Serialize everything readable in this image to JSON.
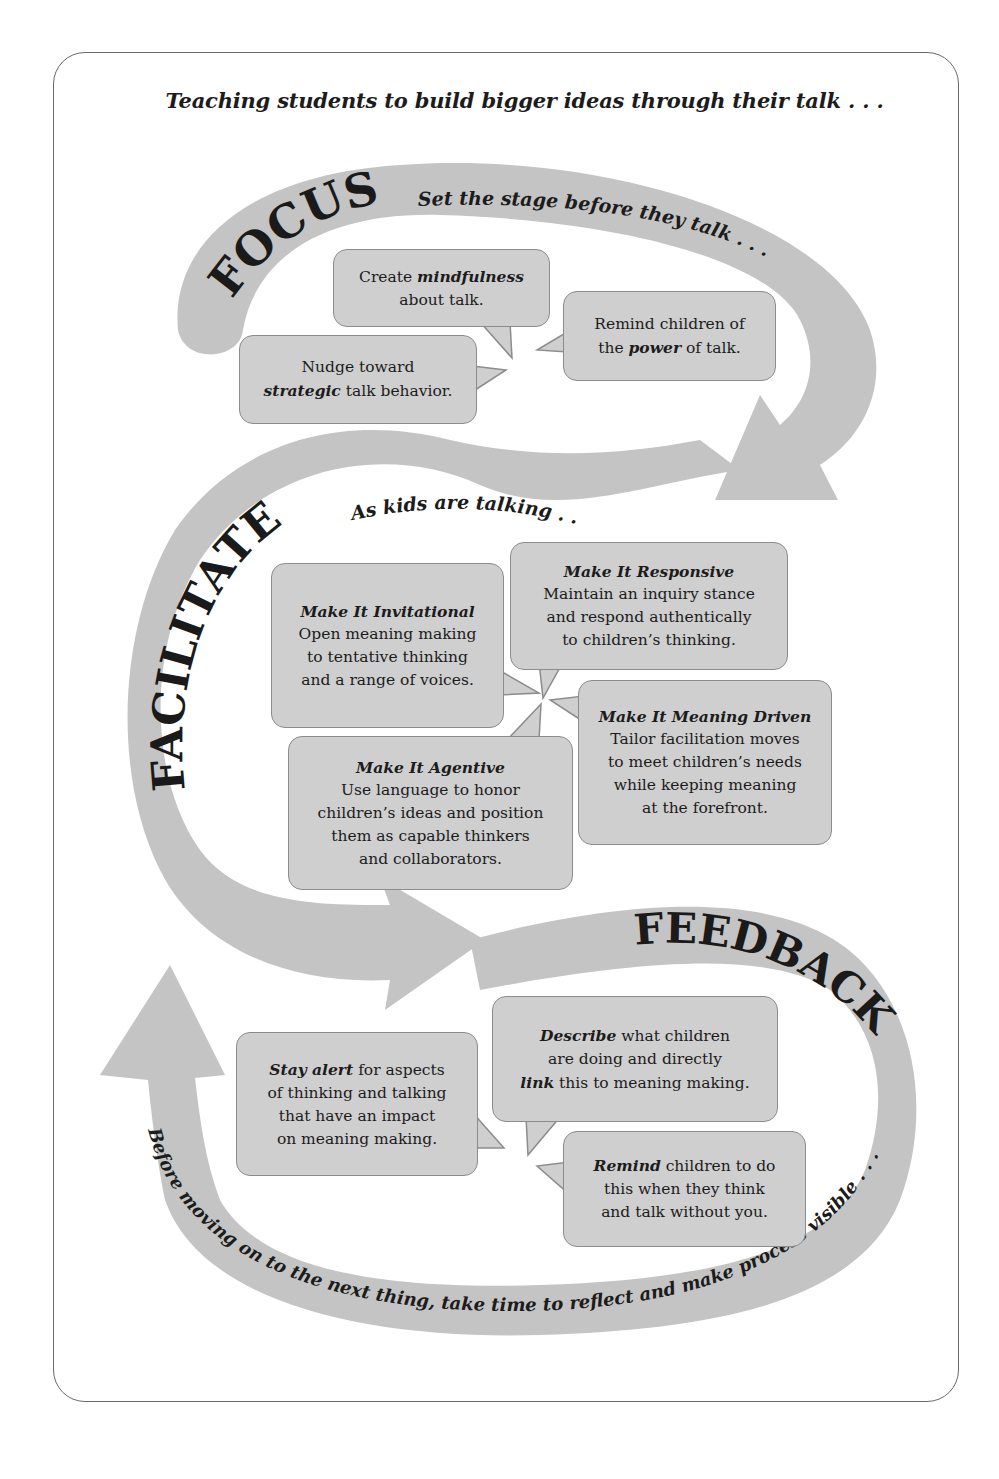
{
  "headline": "Teaching students to build bigger ideas through their talk . . .",
  "stages": {
    "focus": {
      "word": "FOCUS",
      "subtitle": "Set the stage before they talk . . .",
      "bubbles": [
        {
          "pre": "Create ",
          "emph": "mindfulness",
          "post": "",
          "line2": "about talk."
        },
        {
          "pre": "Remind children of",
          "emph": "",
          "post": "",
          "line2_pre": "the ",
          "line2_emph": "power",
          "line2_post": " of talk."
        },
        {
          "pre": "Nudge toward",
          "line2_emph": "strategic",
          "line2_post": " talk behavior."
        }
      ]
    },
    "facilitate": {
      "word": "FACILITATE",
      "subtitle": "As kids are talking . . .",
      "bubbles": [
        {
          "title": "Make It Invitational",
          "body": [
            "Open meaning making",
            "to tentative thinking",
            "and a range of voices."
          ]
        },
        {
          "title": "Make It Responsive",
          "body": [
            "Maintain an inquiry stance",
            "and respond authentically",
            "to children’s thinking."
          ]
        },
        {
          "title": "Make It Meaning Driven",
          "body": [
            "Tailor facilitation moves",
            "to meet children’s needs",
            "while keeping meaning",
            "at the forefront."
          ]
        },
        {
          "title": "Make It Agentive",
          "body": [
            "Use language to honor",
            "children’s ideas and position",
            "them as capable thinkers",
            "and collaborators."
          ]
        }
      ]
    },
    "feedback": {
      "word": "FEEDBACK",
      "subtitle": "Before moving on to the next thing, take time to reflect and make process visible . . .",
      "bubbles": [
        {
          "emph": "Stay alert",
          "rest": " for aspects",
          "body": [
            "of thinking and talking",
            "that have an impact",
            "on meaning making."
          ]
        },
        {
          "emph": "Describe",
          "rest": " what children",
          "body": [
            "are doing and directly"
          ],
          "last_emph": "link",
          "last_rest": " this to meaning making."
        },
        {
          "emph": "Remind",
          "rest": " children to do",
          "body": [
            "this when they think",
            "and talk without you."
          ]
        }
      ]
    }
  },
  "colors": {
    "band": "#c4c4c4",
    "bubble": "#cfcfcf",
    "bubble_border": "#8c8c8c",
    "text": "#1c1c1c",
    "frame": "#6a6a6a"
  }
}
